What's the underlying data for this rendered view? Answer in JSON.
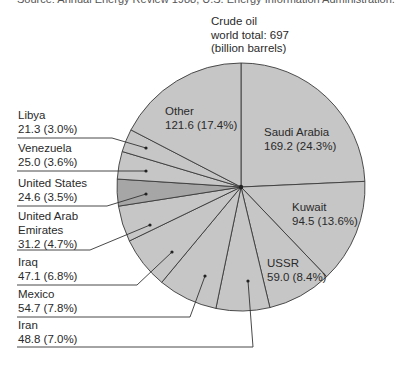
{
  "source_note": "Source: Annual Energy Review 1988, U.S. Energy Information Administration.",
  "chart_data": {
    "type": "pie",
    "title": "Crude oil world total: 697 (billion barrels)",
    "title_lines": [
      "Crude oil",
      "world total: 697",
      "(billion barrels)"
    ],
    "total": 697,
    "unit": "billion barrels",
    "start_angle_deg": 0,
    "direction": "clockwise",
    "slices": [
      {
        "name": "Saudi Arabia",
        "value": 169.2,
        "pct": 24.3,
        "value_label": "169.2 (24.3%)",
        "color": "#c6c6c6"
      },
      {
        "name": "Kuwait",
        "value": 94.5,
        "pct": 13.6,
        "value_label": "94.5 (13.6%)",
        "color": "#c6c6c6"
      },
      {
        "name": "USSR",
        "value": 59.0,
        "pct": 8.4,
        "value_label": "59.0 (8.4%)",
        "color": "#c6c6c6"
      },
      {
        "name": "Iran",
        "value": 48.8,
        "pct": 7.0,
        "value_label": "48.8 (7.0%)",
        "color": "#c6c6c6"
      },
      {
        "name": "Mexico",
        "value": 54.7,
        "pct": 7.8,
        "value_label": "54.7 (7.8%)",
        "color": "#c6c6c6"
      },
      {
        "name": "Iraq",
        "value": 47.1,
        "pct": 6.8,
        "value_label": "47.1 (6.8%)",
        "color": "#c6c6c6"
      },
      {
        "name": "United Arab Emirates",
        "value": 31.2,
        "pct": 4.7,
        "value_label": "31.2 (4.7%)",
        "color": "#c6c6c6"
      },
      {
        "name": "United States",
        "value": 24.6,
        "pct": 3.5,
        "value_label": "24.6 (3.5%)",
        "color": "#a6a6a6"
      },
      {
        "name": "Venezuela",
        "value": 25.0,
        "pct": 3.6,
        "value_label": "25.0 (3.6%)",
        "color": "#c6c6c6"
      },
      {
        "name": "Libya",
        "value": 21.3,
        "pct": 3.0,
        "value_label": "21.3 (3.0%)",
        "color": "#c6c6c6"
      },
      {
        "name": "Other",
        "value": 121.6,
        "pct": 17.4,
        "value_label": "121.6 (17.4%)",
        "color": "#c6c6c6"
      }
    ]
  },
  "labels": {
    "inside": [
      {
        "line1": "Saudi Arabia",
        "line2": "169.2 (24.3%)"
      },
      {
        "line1": "Kuwait",
        "line2": "94.5 (13.6%)"
      },
      {
        "line1": "USSR",
        "line2": "59.0 (8.4%)"
      },
      {
        "line1": "Other",
        "line2": "121.6 (17.4%)"
      }
    ],
    "outside": [
      {
        "line1": "Libya",
        "line2": "21.3 (3.0%)"
      },
      {
        "line1": "Venezuela",
        "line2": "25.0 (3.6%)"
      },
      {
        "line1": "United States",
        "line2": "24.6 (3.5%)"
      },
      {
        "line1": "United Arab",
        "line2": "Emirates",
        "line3": "31.2 (4.7%)"
      },
      {
        "line1": "Iraq",
        "line2": "47.1 (6.8%)"
      },
      {
        "line1": "Mexico",
        "line2": "54.7 (7.8%)"
      },
      {
        "line1": "Iran",
        "line2": "48.8 (7.0%)"
      }
    ]
  }
}
